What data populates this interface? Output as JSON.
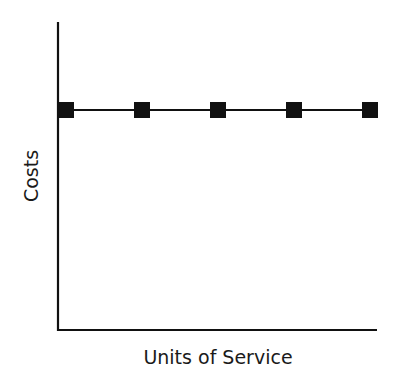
{
  "chart_data": {
    "type": "line",
    "title": "",
    "xlabel": "Units of Service",
    "ylabel": "Costs",
    "x": [
      1,
      2,
      3,
      4,
      5
    ],
    "series": [
      {
        "name": "Fixed Costs",
        "values": [
          1,
          1,
          1,
          1,
          1
        ],
        "marker": "square",
        "color": "#111111"
      }
    ],
    "ylim": [
      0,
      1.4
    ],
    "grid": false,
    "legend": null,
    "tick_labels": false
  }
}
